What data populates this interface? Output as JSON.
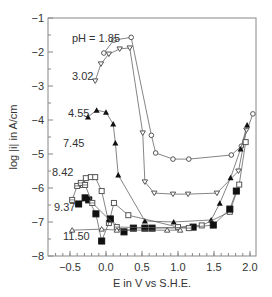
{
  "chart_data": {
    "type": "line",
    "title": "",
    "xlabel": "E in V vs S.H.E.",
    "ylabel": "log |i| in A/cm",
    "xlim": [
      -0.8,
      2.07
    ],
    "ylim": [
      -8,
      -1
    ],
    "xticks": [
      -0.5,
      0.0,
      0.5,
      1.0,
      1.5,
      2.0
    ],
    "xtick_labels": [
      "−0.5",
      "0.0",
      "0.5",
      "1.0",
      "1.5",
      "2.0"
    ],
    "yticks": [
      -1,
      -2,
      -3,
      -4,
      -5,
      -6,
      -7,
      -8
    ],
    "ytick_labels": [
      "−1",
      "−2",
      "−3",
      "−4",
      "−5",
      "−6",
      "−7",
      "−8"
    ],
    "grid": false,
    "legend": "inline labels",
    "series": [
      {
        "name": "pH = 1.85",
        "marker": "circle-open",
        "label_pos": [
          72,
          42
        ],
        "x": [
          -0.03,
          0.11,
          0.35,
          0.63,
          0.69,
          0.93,
          1.15,
          1.74,
          1.88,
          2.04
        ],
        "y": [
          -2.03,
          -1.65,
          -1.57,
          -4.45,
          -4.97,
          -5.15,
          -5.15,
          -5.03,
          -4.77,
          -3.82
        ]
      },
      {
        "name": "3.02",
        "marker": "triangle-down-open",
        "label_pos": [
          72,
          80
        ],
        "x": [
          -0.15,
          -0.07,
          0.04,
          0.19,
          0.33,
          0.51,
          0.54,
          0.67,
          0.93,
          1.14,
          1.54,
          1.84,
          1.95
        ],
        "y": [
          -2.85,
          -2.35,
          -2.06,
          -1.91,
          -1.88,
          -4.38,
          -5.82,
          -6.15,
          -6.18,
          -6.18,
          -6.15,
          -5.5,
          -4.3
        ]
      },
      {
        "name": "4.55",
        "marker": "triangle-filled",
        "label_pos": [
          68,
          117
        ],
        "x": [
          -0.25,
          -0.13,
          0.0,
          0.1,
          0.13,
          0.17,
          0.54,
          0.94,
          1.46,
          1.58,
          1.73,
          1.87,
          1.96
        ],
        "y": [
          -3.91,
          -3.71,
          -3.77,
          -4.12,
          -4.68,
          -5.62,
          -6.97,
          -7.0,
          -6.94,
          -6.45,
          -5.7,
          -4.85,
          -4.15
        ]
      },
      {
        "name": "7.45",
        "marker": "square-open",
        "label_pos": [
          63,
          147
        ],
        "x": [
          -0.32,
          -0.28,
          -0.21,
          -0.15,
          -0.06,
          0.04,
          0.11,
          0.31,
          1.0,
          1.33,
          1.72,
          1.85,
          1.94
        ],
        "y": [
          -5.91,
          -5.71,
          -5.68,
          -5.68,
          -6.09,
          -7.03,
          -6.44,
          -6.8,
          -7.15,
          -7.1,
          -6.7,
          -5.9,
          -4.65
        ]
      },
      {
        "name": "8.42",
        "marker": "square-filled",
        "label_pos": [
          52,
          176
        ],
        "x": [
          -0.38,
          -0.29,
          -0.24,
          -0.14,
          -0.06,
          0.06,
          0.25,
          0.38,
          0.54,
          0.64,
          1.21,
          1.49,
          1.72,
          1.81
        ],
        "y": [
          -6.47,
          -6.29,
          -6.35,
          -6.76,
          -7.56,
          -6.91,
          -7.29,
          -7.18,
          -7.18,
          -7.18,
          -7.15,
          -7.09,
          -6.62,
          -6.09
        ]
      },
      {
        "name": "9.37",
        "marker": "square-crossed",
        "label_pos": [
          54,
          211
        ],
        "x": [
          -0.47,
          -0.4,
          -0.35,
          -0.29,
          -0.19,
          0.15,
          1.15
        ],
        "y": [
          -6.35,
          -5.94,
          -5.85,
          -5.91,
          -6.44,
          -7.15,
          -7.18
        ]
      },
      {
        "name": "11.50",
        "marker": "triangle-up-open",
        "label_pos": [
          63,
          240
        ],
        "x": [
          -0.47,
          -0.06,
          0.15,
          0.85,
          1.03
        ],
        "y": [
          -7.24,
          -7.21,
          -7.24,
          -7.24,
          -7.24
        ]
      }
    ]
  }
}
